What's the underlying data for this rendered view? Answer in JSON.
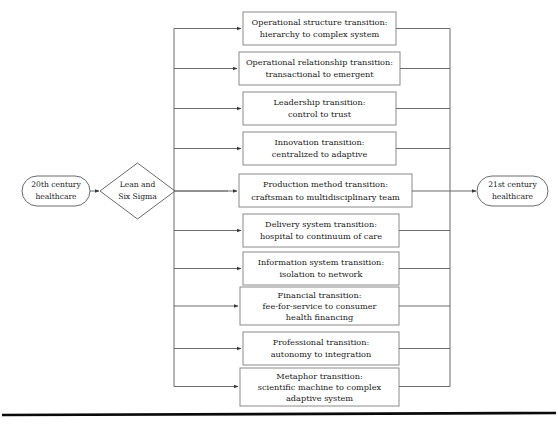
{
  "diagram": {
    "start_node": {
      "label_line1": "20th century",
      "label_line2": "healthcare",
      "shape": "rounded-oval"
    },
    "decision_node": {
      "label_line1": "Lean and",
      "label_line2": "Six Sigma",
      "shape": "diamond"
    },
    "end_node": {
      "label_line1": "21st century",
      "label_line2": "healthcare",
      "shape": "rounded-oval"
    },
    "transitions": [
      {
        "index": 1,
        "name": "operational-structure-transition",
        "lines": [
          "Operational structure transition:",
          "hierarchy to complex system"
        ]
      },
      {
        "index": 2,
        "name": "operational-relationship-transition",
        "lines": [
          "Operational relationship transition:",
          "transactional to emergent"
        ]
      },
      {
        "index": 3,
        "name": "leadership-transition",
        "lines": [
          "Leadership transition:",
          "control to trust"
        ]
      },
      {
        "index": 4,
        "name": "innovation-transition",
        "lines": [
          "Innovation transition:",
          "centralized to adaptive"
        ]
      },
      {
        "index": 5,
        "name": "production-method-transition",
        "lines": [
          "Production method transition:",
          "craftsman to multidisciplinary team"
        ]
      },
      {
        "index": 6,
        "name": "delivery-system-transition",
        "lines": [
          "Delivery system transition:",
          "hospital to continuum of care"
        ]
      },
      {
        "index": 7,
        "name": "information-system-transition",
        "lines": [
          "Information system transition:",
          "isolation to network"
        ]
      },
      {
        "index": 8,
        "name": "financial-transition",
        "lines": [
          "Financial transition:",
          "fee-for-service to consumer",
          "health financing"
        ]
      },
      {
        "index": 9,
        "name": "professional-transition",
        "lines": [
          "Professional transition:",
          "autonomy to integration"
        ]
      },
      {
        "index": 10,
        "name": "metaphor-transition",
        "lines": [
          "Metaphor transition:",
          "scientific machine to complex",
          "adaptive system"
        ]
      }
    ]
  },
  "colors": {
    "background": "#ffffff",
    "node_stroke": "#6b6b6b",
    "text": "#1a1a1a",
    "base_rule": "#0a0a0a"
  }
}
